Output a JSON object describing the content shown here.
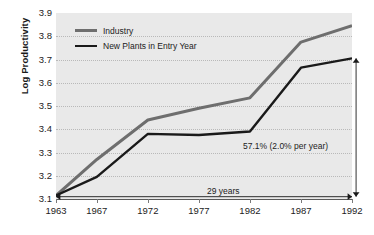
{
  "chart_data": {
    "type": "line",
    "title": "",
    "xlabel": "",
    "ylabel": "Log Productivity",
    "x": [
      1963,
      1967,
      1972,
      1977,
      1982,
      1987,
      1992
    ],
    "xticklabels": [
      "1963",
      "1967",
      "1972",
      "1977",
      "1982",
      "1987",
      "1992"
    ],
    "yticklabels": [
      "3.9",
      "3.8",
      "3.7",
      "3.6",
      "3.5",
      "3.4",
      "3.3",
      "3.2",
      "3.1"
    ],
    "ylim": [
      3.1,
      3.9
    ],
    "ytick_step": 0.1,
    "xlim": [
      1963,
      1992
    ],
    "grid": "horizontal-dotted",
    "legend_position": "top-left-inside",
    "plot_background": "#e9e9e9",
    "series": [
      {
        "name": "Industry",
        "color": "#6e6e6e",
        "linewidth": 3.0,
        "values": [
          3.115,
          3.27,
          3.44,
          3.49,
          3.535,
          3.775,
          3.845
        ]
      },
      {
        "name": "New Plants in Entry Year",
        "color": "#1a1a1a",
        "linewidth": 2.4,
        "values": [
          3.115,
          3.195,
          3.38,
          3.375,
          3.39,
          3.665,
          3.705
        ]
      }
    ],
    "annotations": [
      {
        "name": "growth-percent",
        "text": "57.1% (2.0% per year)",
        "x": 1985.5,
        "y": 3.345
      },
      {
        "name": "span-years",
        "text": "29 years",
        "x": 1978.2,
        "y": 3.118
      }
    ],
    "arrows": [
      {
        "name": "horizontal-span-arrow",
        "orientation": "horizontal",
        "double_headed": true,
        "from": [
          1963,
          3.11
        ],
        "to": [
          1992,
          3.11
        ]
      },
      {
        "name": "vertical-growth-arrow",
        "orientation": "vertical",
        "double_headed": true,
        "from": [
          1992.4,
          3.11
        ],
        "to": [
          1992.4,
          3.705
        ]
      }
    ]
  },
  "legend": {
    "items": [
      {
        "label": "Industry",
        "color": "#6e6e6e"
      },
      {
        "label": "New Plants in Entry Year",
        "color": "#1a1a1a"
      }
    ]
  }
}
